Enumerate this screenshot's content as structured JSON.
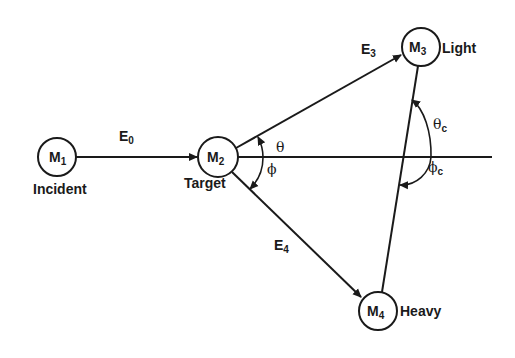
{
  "diagram": {
    "type": "two-body nuclear reaction kinematics",
    "colors": {
      "ink": "#1a1a1a",
      "background": "#ffffff"
    },
    "particles": {
      "m1": {
        "symbol": "M",
        "sub": "1",
        "role": "Incident"
      },
      "m2": {
        "symbol": "M",
        "sub": "2",
        "role": "Target"
      },
      "m3": {
        "symbol": "M",
        "sub": "3",
        "role": "Light"
      },
      "m4": {
        "symbol": "M",
        "sub": "4",
        "role": "Heavy"
      }
    },
    "energies": {
      "e0": {
        "symbol": "E",
        "sub": "0"
      },
      "e3": {
        "symbol": "E",
        "sub": "3"
      },
      "e4": {
        "symbol": "E",
        "sub": "4"
      }
    },
    "angles": {
      "theta": {
        "symbol": "θ",
        "sub": ""
      },
      "phi": {
        "symbol": "ϕ",
        "sub": ""
      },
      "theta_c": {
        "symbol": "θ",
        "sub": "c"
      },
      "phi_c": {
        "symbol": "ϕ",
        "sub": "c"
      }
    }
  }
}
